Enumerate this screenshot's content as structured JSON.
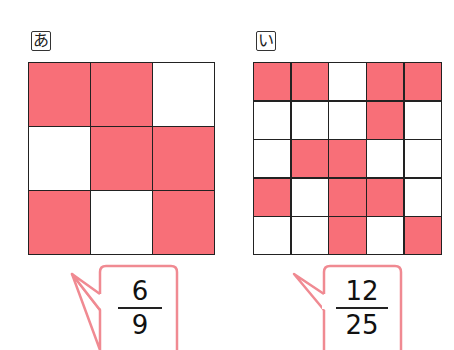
{
  "figures": [
    {
      "label": "あ",
      "rows": 3,
      "cols": 3,
      "cells": [
        [
          1,
          1,
          0
        ],
        [
          0,
          1,
          1
        ],
        [
          1,
          0,
          1
        ]
      ],
      "fraction": {
        "numerator": "6",
        "denominator": "9"
      }
    },
    {
      "label": "い",
      "rows": 5,
      "cols": 5,
      "cells": [
        [
          1,
          1,
          0,
          1,
          1
        ],
        [
          0,
          0,
          0,
          1,
          0
        ],
        [
          0,
          1,
          1,
          0,
          0
        ],
        [
          1,
          0,
          1,
          1,
          0
        ],
        [
          0,
          0,
          1,
          0,
          1
        ]
      ],
      "fraction": {
        "numerator": "12",
        "denominator": "25"
      }
    }
  ],
  "colors": {
    "shaded": "#f86f78",
    "empty": "#ffffff",
    "grid_line": "#222222",
    "bubble_border": "#f08a92"
  }
}
